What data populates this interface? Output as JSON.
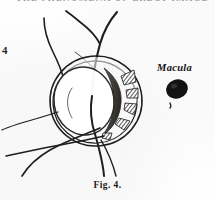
{
  "plate": {
    "running_head": "THE PHENOMENA OF ERECT IMAGE",
    "margin_number": "4",
    "caption": "Fig. 4.",
    "background_color": "#fefefe",
    "ink_color": "#1c1c1c"
  },
  "labels": {
    "macula": "Macula"
  },
  "figure": {
    "parts": [
      {
        "name": "outer-scleral-ring",
        "label": ""
      },
      {
        "name": "inner-scleral-ring",
        "label": ""
      },
      {
        "name": "optic-disc-oval",
        "label": ""
      },
      {
        "name": "dark-crescent",
        "label": ""
      },
      {
        "name": "hatched-segments",
        "label": ""
      },
      {
        "name": "retinal-vessels",
        "label": ""
      },
      {
        "name": "macula-spot",
        "label": ""
      }
    ]
  },
  "colors": {
    "ink": "#1c1c1c",
    "ink_soft": "#3a3a3a",
    "crescent": "#4a4643",
    "paper": "#fefefe",
    "running_head": "#8d8d8d"
  }
}
